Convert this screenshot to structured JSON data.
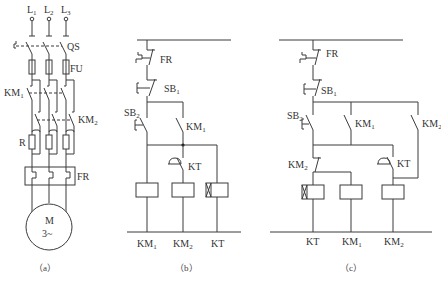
{
  "diagrams": [
    {
      "id": "a",
      "caption": "（a）",
      "title": "Main power circuit",
      "labels": {
        "l1": "L",
        "l1_sub": "1",
        "l2": "L",
        "l2_sub": "2",
        "l3": "L",
        "l3_sub": "3",
        "qs": "QS",
        "fu": "FU",
        "km1": "KM",
        "km1_sub": "1",
        "km2": "KM",
        "km2_sub": "2",
        "r": "R",
        "fr": "FR",
        "motor": "M",
        "motor_phase": "3~"
      }
    },
    {
      "id": "b",
      "caption": "（b）",
      "title": "Control circuit (b)",
      "labels": {
        "fr": "FR",
        "sb1": "SB",
        "sb1_sub": "1",
        "sb2": "SB",
        "sb2_sub": "2",
        "km1_contact": "KM",
        "km1_contact_sub": "1",
        "kt_contact": "KT",
        "coil1": "KM",
        "coil1_sub": "1",
        "coil2": "KM",
        "coil2_sub": "2",
        "coil3": "KT"
      }
    },
    {
      "id": "c",
      "caption": "（c）",
      "title": "Control circuit (c)",
      "labels": {
        "fr": "FR",
        "sb1": "SB",
        "sb1_sub": "1",
        "sb2": "SB",
        "sb2_sub": "2",
        "km1_contact": "KM",
        "km1_contact_sub": "1",
        "km2_contact": "KM",
        "km2_contact_sub": "2",
        "km2_nc": "KM",
        "km2_nc_sub": "2",
        "kt_contact": "KT",
        "coil1": "KT",
        "coil2": "KM",
        "coil2_sub": "1",
        "coil3": "KM",
        "coil3_sub": "2"
      }
    }
  ]
}
